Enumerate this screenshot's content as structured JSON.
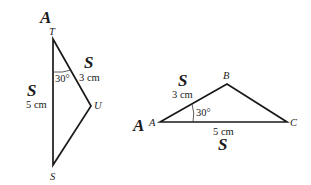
{
  "triangle_left": {
    "vertices": {
      "T": {
        "label": "T",
        "x": 53,
        "y": 39
      },
      "U": {
        "label": "U",
        "x": 91,
        "y": 106
      },
      "S": {
        "label": "S",
        "x": 53,
        "y": 165
      }
    },
    "sides": {
      "TU": {
        "length": "3 cm",
        "tag": "S"
      },
      "TS": {
        "length": "5 cm",
        "tag": "S"
      }
    },
    "angle_T": {
      "value": "30°",
      "tag": "A"
    }
  },
  "triangle_right": {
    "vertices": {
      "A": {
        "label": "A",
        "x": 160,
        "y": 122
      },
      "B": {
        "label": "B",
        "x": 227,
        "y": 84
      },
      "C": {
        "label": "C",
        "x": 287,
        "y": 122
      }
    },
    "sides": {
      "AB": {
        "length": "3 cm",
        "tag": "S"
      },
      "AC": {
        "length": "5 cm",
        "tag": "S"
      }
    },
    "angle_A": {
      "value": "30°",
      "tag": "A"
    }
  }
}
